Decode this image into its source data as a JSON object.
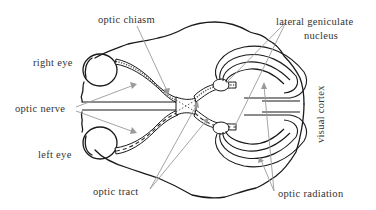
{
  "diagram": {
    "labels": {
      "optic_chiasm": "optic chiasm",
      "lateral_geniculate_line1": "lateral geniculate",
      "lateral_geniculate_line2": "nucleus",
      "right_eye": "right eye",
      "optic_nerve": "optic nerve",
      "left_eye": "left eye",
      "visual_cortex": "visual cortex",
      "optic_tract": "optic tract",
      "optic_radiation": "optic radiation"
    },
    "colors": {
      "outline": "#1a1a1a",
      "pointer": "#9a9a9a",
      "text": "#333333",
      "background": "#ffffff"
    }
  }
}
